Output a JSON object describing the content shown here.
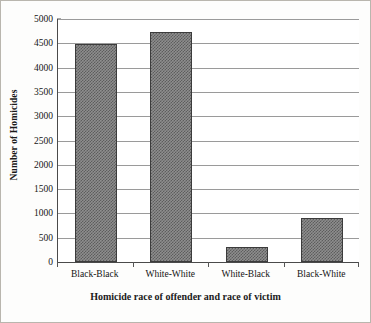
{
  "chart_data": {
    "type": "bar",
    "title": "",
    "subtitle": "",
    "xlabel": "Homicide race of offender and race of victim",
    "ylabel": "Number of Homicides",
    "categories": [
      "Black-Black",
      "White-White",
      "White-Black",
      "Black-White"
    ],
    "values": [
      4490,
      4730,
      310,
      900
    ],
    "series": [
      {
        "name": "Number of Homicides",
        "values": [
          4490,
          4730,
          310,
          900
        ]
      }
    ],
    "ylim": [
      0,
      5000
    ],
    "ytick_labels": [
      "0",
      "500",
      "1000",
      "1500",
      "2000",
      "2500",
      "3000",
      "3500",
      "4000",
      "4500",
      "5000"
    ],
    "ytick_values": [
      0,
      500,
      1000,
      1500,
      2000,
      2500,
      3000,
      3500,
      4000,
      4500,
      5000
    ],
    "grid": true,
    "grid_axis": "y",
    "legend": false,
    "legend_position": "none",
    "bar_fill_color": "#8e8e8e",
    "bar_pattern": "checkerboard-hatch",
    "bar_border_color": "#3c3c3c",
    "gridline_color": "#9a9a9a",
    "axis_color": "#4a4a4a",
    "frame_border_color": "#b9b6ae",
    "background_color": "#ffffff"
  }
}
